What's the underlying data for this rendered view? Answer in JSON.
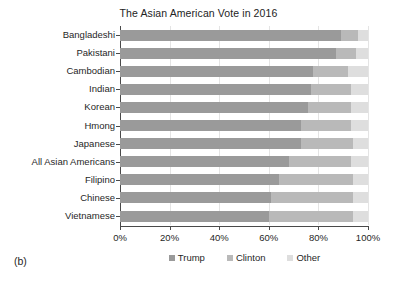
{
  "panel_label": "(b)",
  "chart_data": {
    "type": "bar",
    "orientation": "horizontal",
    "stacked": true,
    "stack_total": 100,
    "title": "The Asian American Vote in 2016",
    "xlabel": "",
    "ylabel": "",
    "xlim": [
      0,
      100
    ],
    "xticks": [
      0,
      20,
      40,
      60,
      80,
      100
    ],
    "xticklabels": [
      "0%",
      "20%",
      "40%",
      "60%",
      "80%",
      "100%"
    ],
    "grid": true,
    "legend_position": "bottom-center",
    "categories": [
      "Bangladeshi",
      "Pakistani",
      "Cambodian",
      "Indian",
      "Korean",
      "Hmong",
      "Japanese",
      "All Asian Americans",
      "Filipino",
      "Chinese",
      "Vietnamese"
    ],
    "series": [
      {
        "name": "Trump",
        "color": "#9a9a9a",
        "values": [
          89,
          87,
          78,
          77,
          76,
          73,
          73,
          68,
          64,
          61,
          60
        ]
      },
      {
        "name": "Clinton",
        "color": "#b9b9b9",
        "values": [
          7,
          8,
          14,
          16,
          17,
          20,
          21,
          25,
          30,
          33,
          34
        ]
      },
      {
        "name": "Other",
        "color": "#dedede",
        "values": [
          4,
          5,
          8,
          7,
          7,
          7,
          6,
          7,
          6,
          6,
          6
        ]
      }
    ]
  }
}
